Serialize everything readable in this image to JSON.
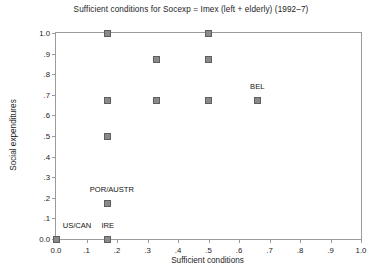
{
  "chart_data": {
    "type": "scatter",
    "title": "Sufficient conditions for Socexp = Imex (left + elderly) (1992–7)",
    "xlabel": "Sufficient conditions",
    "ylabel": "Social expenditures",
    "xlim": [
      0.0,
      1.0
    ],
    "ylim": [
      0.0,
      1.0
    ],
    "grid": false,
    "legend": "none",
    "xticks": [
      "0.0",
      ".1",
      ".2",
      ".3",
      ".4",
      ".5",
      ".6",
      ".7",
      ".8",
      ".9",
      "1.0"
    ],
    "xtick_values": [
      0.0,
      0.1,
      0.2,
      0.3,
      0.4,
      0.5,
      0.6,
      0.7,
      0.8,
      0.9,
      1.0
    ],
    "yticks": [
      "0.0",
      ".1",
      ".2",
      ".3",
      ".4",
      ".5",
      ".6",
      ".7",
      ".8",
      ".9",
      "1.0"
    ],
    "ytick_values": [
      0.0,
      0.1,
      0.2,
      0.3,
      0.4,
      0.5,
      0.6,
      0.7,
      0.8,
      0.9,
      1.0
    ],
    "marker": "square",
    "marker_color": "#8a8a8a",
    "marker_edge_color": "#5f5f5f",
    "points": [
      {
        "x": 0.17,
        "y": 1.0,
        "label": ""
      },
      {
        "x": 0.5,
        "y": 1.0,
        "label": ""
      },
      {
        "x": 0.33,
        "y": 0.87,
        "label": ""
      },
      {
        "x": 0.5,
        "y": 0.87,
        "label": ""
      },
      {
        "x": 0.17,
        "y": 0.67,
        "label": ""
      },
      {
        "x": 0.33,
        "y": 0.67,
        "label": ""
      },
      {
        "x": 0.5,
        "y": 0.67,
        "label": ""
      },
      {
        "x": 0.66,
        "y": 0.67,
        "label": "BEL"
      },
      {
        "x": 0.17,
        "y": 0.5,
        "label": ""
      },
      {
        "x": 0.17,
        "y": 0.17,
        "label": "POR/AUSTR"
      },
      {
        "x": 0.0,
        "y": 0.0,
        "label": "US/CAN"
      },
      {
        "x": 0.17,
        "y": 0.0,
        "label": "IRE"
      }
    ],
    "annotations": [
      {
        "text": "BEL",
        "x": 0.66,
        "y": 0.67,
        "dx": 0,
        "dy": 13
      },
      {
        "text": "POR/AUSTR",
        "x": 0.17,
        "y": 0.17,
        "dx": 4,
        "dy": 13
      },
      {
        "text": "US/CAN",
        "x": 0.0,
        "y": 0.0,
        "dx": 21,
        "dy": 12
      },
      {
        "text": "IRE",
        "x": 0.17,
        "y": 0.0,
        "dx": 0,
        "dy": 12
      }
    ]
  }
}
